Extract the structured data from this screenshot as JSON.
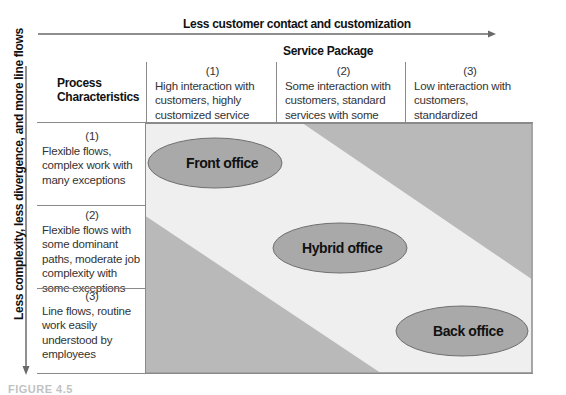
{
  "axes": {
    "horizontal_label": "Less customer contact and customization",
    "vertical_label": "Less complexity, less divergence, and more line flows"
  },
  "header": {
    "service_package_title": "Service Package",
    "process_characteristics_title_line1": "Process",
    "process_characteristics_title_line2": "Characteristics",
    "columns": [
      {
        "number": "(1)",
        "lines": [
          "High interaction with",
          "customers, highly",
          "customized service"
        ]
      },
      {
        "number": "(2)",
        "lines": [
          "Some interaction with",
          "customers, standard",
          "services with some options"
        ]
      },
      {
        "number": "(3)",
        "lines": [
          "Low interaction with",
          "customers, standardized",
          "services"
        ]
      }
    ]
  },
  "rows": [
    {
      "number": "(1)",
      "lines": [
        "Flexible flows,",
        "complex work with",
        "many exceptions"
      ]
    },
    {
      "number": "(2)",
      "lines": [
        "Flexible flows with",
        "some dominant",
        "paths, moderate job",
        "complexity with",
        "some exceptions"
      ]
    },
    {
      "number": "(3)",
      "lines": [
        "Line flows, routine",
        "work easily",
        "understood by",
        "employees"
      ]
    }
  ],
  "regions": {
    "front_office": "Front office",
    "hybrid_office": "Hybrid office",
    "back_office": "Back office"
  },
  "colors": {
    "dark_region": "#b9b9b9",
    "band": "#efefef",
    "ellipse_fill": "#a9a9a9",
    "ellipse_stroke": "#6f6f6f",
    "grid_line": "#8a8a8a"
  },
  "caption": {
    "visible_fragment": "FIGURE 4.5"
  }
}
